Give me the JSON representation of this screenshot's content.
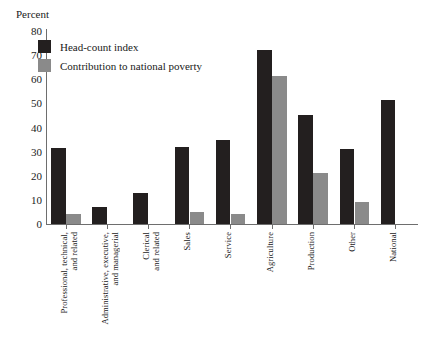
{
  "chart_data": {
    "type": "bar",
    "title": "",
    "xlabel": "",
    "ylabel": "Percent",
    "ylim": [
      0,
      80
    ],
    "yticks": [
      0,
      10,
      20,
      30,
      40,
      50,
      60,
      70,
      80
    ],
    "grid": false,
    "legend_position": "top-left",
    "categories": [
      "Professional, technical, and related",
      "Administrative, executive, and managerial",
      "Clerical and related",
      "Sales",
      "Service",
      "Agriculture",
      "Production",
      "Other",
      "National"
    ],
    "series": [
      {
        "name": "Head-count index",
        "color": "#231f1f",
        "values": [
          31.5,
          7,
          13,
          32,
          35,
          72,
          45,
          31,
          51.5
        ]
      },
      {
        "name": "Contribution to national poverty",
        "color": "#8a8a8a",
        "values": [
          4,
          0,
          0,
          5,
          4,
          61.5,
          21,
          9,
          0
        ]
      }
    ]
  },
  "legend": {
    "items": [
      {
        "label": "Head-count index",
        "swatch": "dark"
      },
      {
        "label": "Contribution to national poverty",
        "swatch": "light"
      }
    ]
  },
  "axis": {
    "y_label": "Percent"
  }
}
